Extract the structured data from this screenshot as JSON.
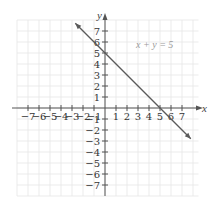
{
  "chart_data": {
    "type": "line",
    "title": "",
    "xlabel": "x",
    "ylabel": "y",
    "xlim": [
      -8,
      8
    ],
    "ylim": [
      -8,
      8
    ],
    "grid": true,
    "x_ticks": [
      -7,
      -6,
      -5,
      -4,
      -3,
      -2,
      -1,
      1,
      2,
      3,
      4,
      5,
      6,
      7
    ],
    "y_ticks": [
      -7,
      -6,
      -5,
      -4,
      -3,
      -2,
      -1,
      1,
      2,
      3,
      4,
      5,
      6,
      7
    ],
    "x_tick_labels": [
      "-7",
      "-6",
      "-5",
      "-4",
      "-3",
      "-2",
      "-1",
      "1",
      "2",
      "3",
      "4",
      "5",
      "6",
      "7"
    ],
    "y_tick_labels": [
      "-7",
      "-6",
      "-5",
      "-4",
      "-3",
      "-2",
      "-1",
      "1",
      "2",
      "3",
      "4",
      "5",
      "6",
      "7"
    ],
    "series": [
      {
        "name": "x + y = 5",
        "equation": "x + y = 5",
        "x": [
          -2.7,
          0,
          5,
          7.8
        ],
        "y": [
          7.7,
          5,
          0,
          -2.8
        ],
        "arrows": "both"
      }
    ],
    "annotations": [
      {
        "text": "x + y = 5",
        "x": 3.8,
        "y": 5.5
      }
    ],
    "intercepts": {
      "x_intercept": [
        5,
        0
      ],
      "y_intercept": [
        0,
        5
      ]
    }
  },
  "labels": {
    "x_axis": "x",
    "y_axis": "y",
    "equation": "x + y = 5"
  },
  "colors": {
    "grid": "#e6e6e6",
    "axis": "#555555",
    "line": "#5a5a5a",
    "equation_label": "#9a9a9a"
  }
}
